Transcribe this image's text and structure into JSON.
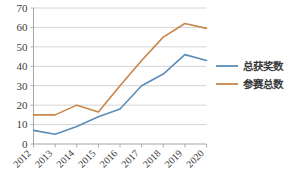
{
  "chart_data": {
    "type": "line",
    "title": "",
    "xlabel": "",
    "ylabel": "",
    "categories": [
      "2012",
      "2013",
      "2014",
      "2015",
      "2016",
      "2017",
      "2018",
      "2019",
      "2020"
    ],
    "series": [
      {
        "name": "总获奖数",
        "color": "#5B8DB8",
        "values": [
          7,
          5,
          9,
          14,
          18,
          30,
          36,
          46,
          43
        ]
      },
      {
        "name": "参赛总数",
        "color": "#C8864A",
        "values": [
          15,
          15,
          20,
          16.5,
          30,
          43,
          55,
          62,
          59.5
        ]
      }
    ],
    "ylim": [
      0,
      70
    ],
    "yticks": [
      0,
      10,
      20,
      30,
      40,
      50,
      60,
      70
    ],
    "ytick_labels": [
      "0",
      "10",
      "20",
      "30",
      "40",
      "50",
      "60",
      "70"
    ],
    "grid": true,
    "legend_position": "right"
  },
  "axes": {
    "y_axis_name": "value-axis",
    "x_axis_name": "year-axis"
  },
  "legend": {
    "entries": [
      {
        "label": "总获奖数",
        "color": "#5B8DB8"
      },
      {
        "label": "参赛总数",
        "color": "#C8864A"
      }
    ]
  }
}
